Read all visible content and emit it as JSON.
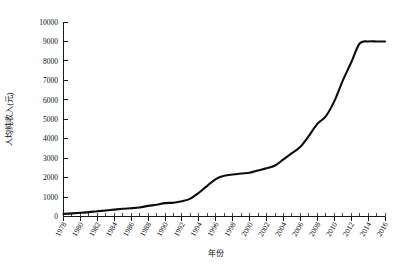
{
  "chart_data": {
    "type": "line",
    "title": "",
    "xlabel": "年份",
    "ylabel": "人均纯收入(元)",
    "xlim": [
      1978,
      2016
    ],
    "ylim": [
      0,
      10000
    ],
    "grid": false,
    "legend": "none",
    "line_color": "#0d0d0d",
    "x": [
      1978,
      1979,
      1980,
      1981,
      1982,
      1983,
      1984,
      1985,
      1986,
      1987,
      1988,
      1989,
      1990,
      1991,
      1992,
      1993,
      1994,
      1995,
      1996,
      1997,
      1998,
      1999,
      2000,
      2001,
      2002,
      2003,
      2004,
      2005,
      2006,
      2007,
      2008,
      2009,
      2010,
      2011,
      2012,
      2013,
      2014,
      2015,
      2016
    ],
    "values": [
      134,
      160,
      191,
      223,
      270,
      310,
      355,
      398,
      424,
      463,
      545,
      602,
      686,
      709,
      784,
      922,
      1221,
      1578,
      1926,
      2090,
      2162,
      2210,
      2253,
      2366,
      2476,
      2622,
      2936,
      3255,
      3587,
      4140,
      4761,
      5153,
      5919,
      6977,
      7917,
      8896,
      9892,
      10772,
      11636
    ],
    "series": [
      {
        "name": "农村居民人均纯收入",
        "values": [
          134,
          160,
          191,
          223,
          270,
          310,
          355,
          398,
          424,
          463,
          545,
          602,
          686,
          709,
          784,
          922,
          1221,
          1578,
          1926,
          2090,
          2162,
          2210,
          2253,
          2366,
          2476,
          2622,
          2936,
          3255,
          3587,
          4140,
          4761,
          5153,
          5919,
          6977,
          7917,
          8896,
          9892,
          10772,
          11636
        ]
      }
    ],
    "x_tick_labels": [
      "1978",
      "1980",
      "1982",
      "1984",
      "1986",
      "1988",
      "1990",
      "1992",
      "1994",
      "1996",
      "1998",
      "2000",
      "2002",
      "2004",
      "2006",
      "2008",
      "2010",
      "2012",
      "2014",
      "2016"
    ],
    "x_tick_values": [
      1978,
      1980,
      1982,
      1984,
      1986,
      1988,
      1990,
      1992,
      1994,
      1996,
      1998,
      2000,
      2002,
      2004,
      2006,
      2008,
      2010,
      2012,
      2014,
      2016
    ],
    "y_tick_labels": [
      "0",
      "1000",
      "2000",
      "3000",
      "4000",
      "5000",
      "6000",
      "7000",
      "8000",
      "9000",
      "10000"
    ],
    "y_tick_values": [
      0,
      1000,
      2000,
      3000,
      4000,
      5000,
      6000,
      7000,
      8000,
      9000,
      10000
    ],
    "plot_values_rendered": [
      134,
      160,
      191,
      223,
      270,
      310,
      355,
      398,
      424,
      463,
      545,
      602,
      686,
      709,
      784,
      922,
      1221,
      1578,
      1926,
      2090,
      2162,
      2210,
      2253,
      2366,
      2476,
      2622,
      2936,
      3255,
      3587,
      4140,
      4761,
      5153,
      5919,
      6977,
      7917,
      8896,
      9000,
      9000,
      9000
    ]
  },
  "labels": {
    "y_axis_title": "人均纯收入(元)",
    "x_axis_title": "年份"
  }
}
